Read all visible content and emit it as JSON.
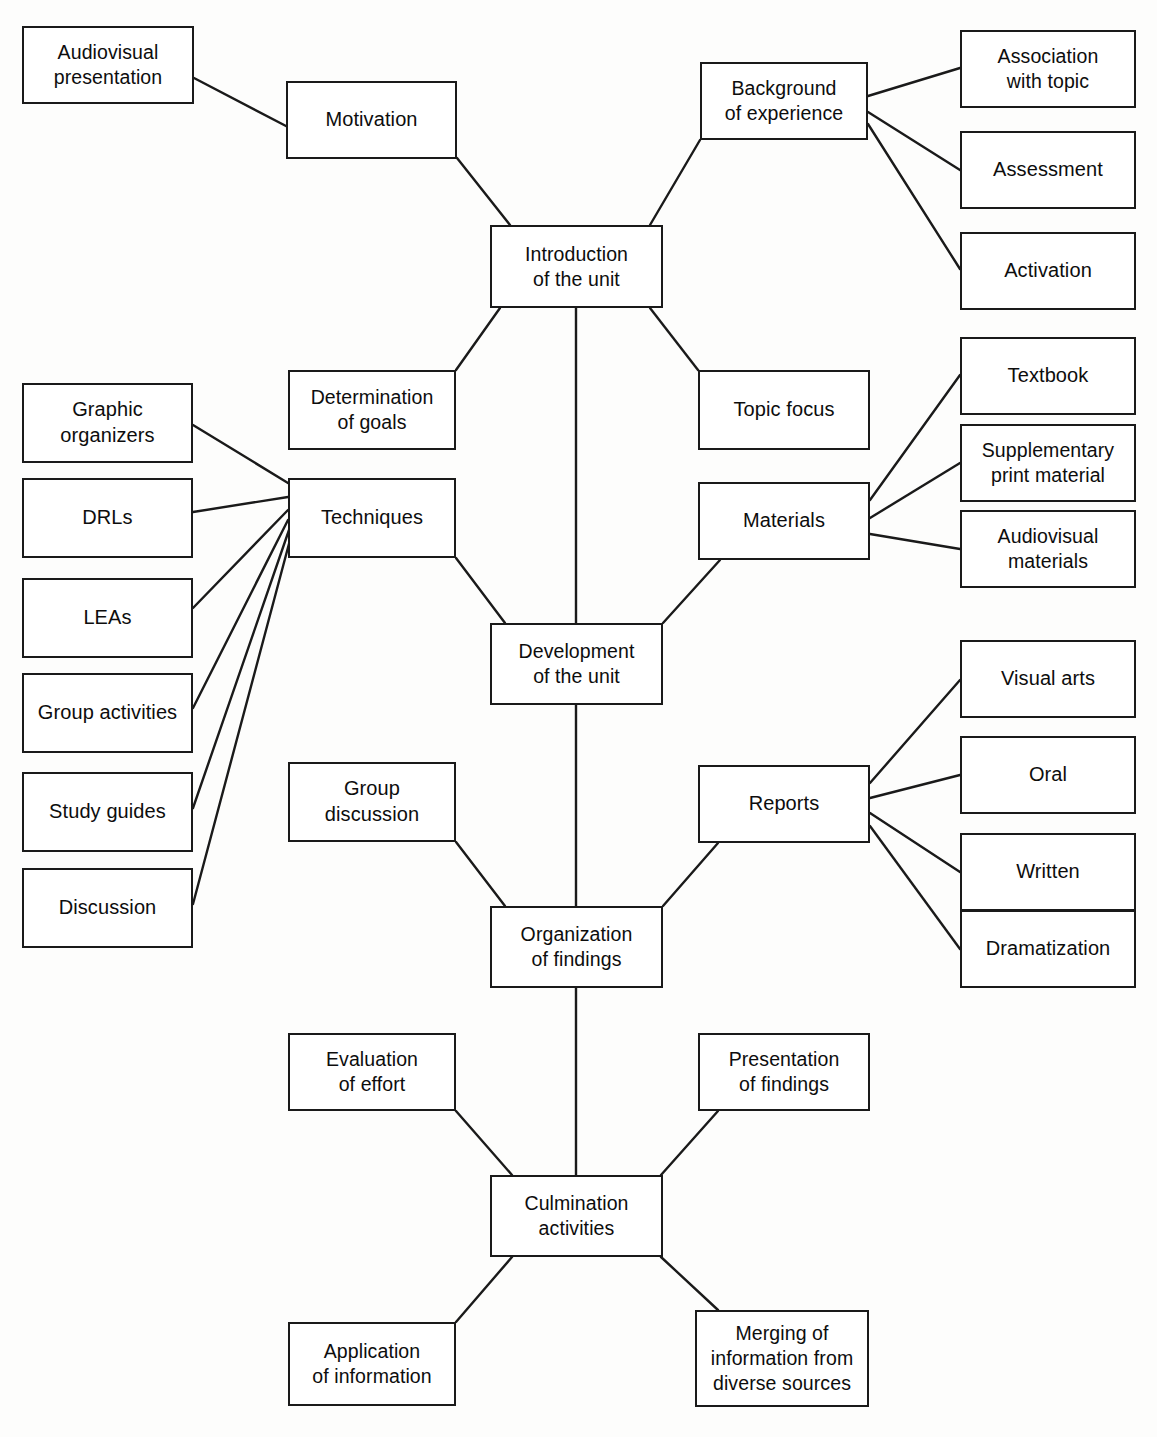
{
  "diagram": {
    "type": "hierarchical-flow",
    "line_color": "#1a1a1a",
    "box_fill": "#ffffff",
    "background": "#fdfdfc",
    "ghost_text": "",
    "nodes": [
      {
        "id": "audiovisual_presentation",
        "label": "Audiovisual\npresentation",
        "x": 22,
        "y": 26,
        "w": 172,
        "h": 78
      },
      {
        "id": "motivation",
        "label": "Motivation",
        "x": 286,
        "y": 81,
        "w": 171,
        "h": 78
      },
      {
        "id": "background_of_experience",
        "label": "Background\nof experience",
        "x": 700,
        "y": 62,
        "w": 168,
        "h": 78
      },
      {
        "id": "association_with_topic",
        "label": "Association\nwith topic",
        "x": 960,
        "y": 30,
        "w": 176,
        "h": 78
      },
      {
        "id": "assessment",
        "label": "Assessment",
        "x": 960,
        "y": 131,
        "w": 176,
        "h": 78
      },
      {
        "id": "activation",
        "label": "Activation",
        "x": 960,
        "y": 232,
        "w": 176,
        "h": 78
      },
      {
        "id": "introduction_of_the_unit",
        "label": "Introduction\nof the unit",
        "x": 490,
        "y": 225,
        "w": 173,
        "h": 83
      },
      {
        "id": "graphic_organizers",
        "label": "Graphic\norganizers",
        "x": 22,
        "y": 383,
        "w": 171,
        "h": 80
      },
      {
        "id": "drls",
        "label": "DRLs",
        "x": 22,
        "y": 478,
        "w": 171,
        "h": 80
      },
      {
        "id": "leas",
        "label": "LEAs",
        "x": 22,
        "y": 578,
        "w": 171,
        "h": 80
      },
      {
        "id": "group_activities",
        "label": "Group activities",
        "x": 22,
        "y": 673,
        "w": 171,
        "h": 80
      },
      {
        "id": "study_guides",
        "label": "Study guides",
        "x": 22,
        "y": 772,
        "w": 171,
        "h": 80
      },
      {
        "id": "discussion",
        "label": "Discussion",
        "x": 22,
        "y": 868,
        "w": 171,
        "h": 80
      },
      {
        "id": "determination_of_goals",
        "label": "Determination\nof goals",
        "x": 288,
        "y": 370,
        "w": 168,
        "h": 80
      },
      {
        "id": "techniques",
        "label": "Techniques",
        "x": 288,
        "y": 478,
        "w": 168,
        "h": 80
      },
      {
        "id": "topic_focus",
        "label": "Topic focus",
        "x": 698,
        "y": 370,
        "w": 172,
        "h": 80
      },
      {
        "id": "materials",
        "label": "Materials",
        "x": 698,
        "y": 482,
        "w": 172,
        "h": 78
      },
      {
        "id": "textbook",
        "label": "Textbook",
        "x": 960,
        "y": 337,
        "w": 176,
        "h": 78
      },
      {
        "id": "supplementary_print",
        "label": "Supplementary\nprint material",
        "x": 960,
        "y": 424,
        "w": 176,
        "h": 78
      },
      {
        "id": "audiovisual_materials",
        "label": "Audiovisual\nmaterials",
        "x": 960,
        "y": 510,
        "w": 176,
        "h": 78
      },
      {
        "id": "development_of_the_unit",
        "label": "Development\nof the unit",
        "x": 490,
        "y": 623,
        "w": 173,
        "h": 82
      },
      {
        "id": "visual_arts",
        "label": "Visual arts",
        "x": 960,
        "y": 640,
        "w": 176,
        "h": 78
      },
      {
        "id": "oral",
        "label": "Oral",
        "x": 960,
        "y": 736,
        "w": 176,
        "h": 78
      },
      {
        "id": "written",
        "label": "Written",
        "x": 960,
        "y": 833,
        "w": 176,
        "h": 78
      },
      {
        "id": "dramatization",
        "label": "Dramatization",
        "x": 960,
        "y": 910,
        "w": 176,
        "h": 78
      },
      {
        "id": "group_discussion",
        "label": "Group\ndiscussion",
        "x": 288,
        "y": 762,
        "w": 168,
        "h": 80
      },
      {
        "id": "reports",
        "label": "Reports",
        "x": 698,
        "y": 765,
        "w": 172,
        "h": 78
      },
      {
        "id": "organization_of_findings",
        "label": "Organization\nof findings",
        "x": 490,
        "y": 906,
        "w": 173,
        "h": 82
      },
      {
        "id": "evaluation_of_effort",
        "label": "Evaluation\nof effort",
        "x": 288,
        "y": 1033,
        "w": 168,
        "h": 78
      },
      {
        "id": "presentation_of_findings",
        "label": "Presentation\nof findings",
        "x": 698,
        "y": 1033,
        "w": 172,
        "h": 78
      },
      {
        "id": "culmination_activities",
        "label": "Culmination\nactivities",
        "x": 490,
        "y": 1175,
        "w": 173,
        "h": 82
      },
      {
        "id": "application_of_information",
        "label": "Application\nof information",
        "x": 288,
        "y": 1322,
        "w": 168,
        "h": 84
      },
      {
        "id": "merging_of_information",
        "label": "Merging of\ninformation from\ndiverse sources",
        "x": 695,
        "y": 1310,
        "w": 174,
        "h": 97
      }
    ],
    "edges": [
      {
        "from": "audiovisual_presentation",
        "to": "motivation",
        "x1": 194,
        "y1": 78,
        "x2": 286,
        "y2": 126
      },
      {
        "from": "motivation",
        "to": "introduction_of_the_unit",
        "x1": 457,
        "y1": 158,
        "x2": 510,
        "y2": 225
      },
      {
        "from": "background_of_experience",
        "to": "introduction_of_the_unit",
        "x1": 700,
        "y1": 140,
        "x2": 650,
        "y2": 225
      },
      {
        "from": "background_of_experience",
        "to": "association_with_topic",
        "x1": 868,
        "y1": 96,
        "x2": 960,
        "y2": 68
      },
      {
        "from": "background_of_experience",
        "to": "assessment",
        "x1": 868,
        "y1": 112,
        "x2": 960,
        "y2": 170
      },
      {
        "from": "background_of_experience",
        "to": "activation",
        "x1": 868,
        "y1": 124,
        "x2": 960,
        "y2": 269
      },
      {
        "from": "introduction_of_the_unit",
        "to": "determination_of_goals",
        "x1": 500,
        "y1": 308,
        "x2": 456,
        "y2": 370
      },
      {
        "from": "introduction_of_the_unit",
        "to": "topic_focus",
        "x1": 650,
        "y1": 308,
        "x2": 698,
        "y2": 370
      },
      {
        "from": "introduction_of_the_unit",
        "to": "development_of_the_unit",
        "x1": 576,
        "y1": 308,
        "x2": 576,
        "y2": 623
      },
      {
        "from": "graphic_organizers",
        "to": "techniques",
        "x1": 193,
        "y1": 425,
        "x2": 288,
        "y2": 483
      },
      {
        "from": "drls",
        "to": "techniques",
        "x1": 193,
        "y1": 512,
        "x2": 288,
        "y2": 497
      },
      {
        "from": "leas",
        "to": "techniques",
        "x1": 193,
        "y1": 608,
        "x2": 288,
        "y2": 510
      },
      {
        "from": "group_activities",
        "to": "techniques",
        "x1": 193,
        "y1": 708,
        "x2": 288,
        "y2": 520
      },
      {
        "from": "study_guides",
        "to": "techniques",
        "x1": 193,
        "y1": 808,
        "x2": 289,
        "y2": 530
      },
      {
        "from": "discussion",
        "to": "techniques",
        "x1": 193,
        "y1": 904,
        "x2": 290,
        "y2": 540
      },
      {
        "from": "techniques",
        "to": "development_of_the_unit",
        "x1": 456,
        "y1": 558,
        "x2": 505,
        "y2": 623
      },
      {
        "from": "materials",
        "to": "textbook",
        "x1": 870,
        "y1": 500,
        "x2": 960,
        "y2": 375
      },
      {
        "from": "materials",
        "to": "supplementary_print",
        "x1": 870,
        "y1": 518,
        "x2": 960,
        "y2": 463
      },
      {
        "from": "materials",
        "to": "audiovisual_materials",
        "x1": 870,
        "y1": 534,
        "x2": 960,
        "y2": 549
      },
      {
        "from": "materials",
        "to": "development_of_the_unit",
        "x1": 720,
        "y1": 560,
        "x2": 663,
        "y2": 623
      },
      {
        "from": "development_of_the_unit",
        "to": "organization_of_findings",
        "x1": 576,
        "y1": 705,
        "x2": 576,
        "y2": 906
      },
      {
        "from": "group_discussion",
        "to": "organization_of_findings",
        "x1": 456,
        "y1": 842,
        "x2": 505,
        "y2": 906
      },
      {
        "from": "reports",
        "to": "organization_of_findings",
        "x1": 718,
        "y1": 843,
        "x2": 663,
        "y2": 906
      },
      {
        "from": "reports",
        "to": "visual_arts",
        "x1": 870,
        "y1": 783,
        "x2": 960,
        "y2": 680
      },
      {
        "from": "reports",
        "to": "oral",
        "x1": 870,
        "y1": 798,
        "x2": 960,
        "y2": 775
      },
      {
        "from": "reports",
        "to": "written",
        "x1": 870,
        "y1": 813,
        "x2": 960,
        "y2": 872
      },
      {
        "from": "reports",
        "to": "dramatization",
        "x1": 870,
        "y1": 826,
        "x2": 960,
        "y2": 949
      },
      {
        "from": "organization_of_findings",
        "to": "culmination_activities",
        "x1": 576,
        "y1": 988,
        "x2": 576,
        "y2": 1175
      },
      {
        "from": "evaluation_of_effort",
        "to": "culmination_activities",
        "x1": 456,
        "y1": 1111,
        "x2": 512,
        "y2": 1175
      },
      {
        "from": "presentation_of_findings",
        "to": "culmination_activities",
        "x1": 718,
        "y1": 1111,
        "x2": 661,
        "y2": 1175
      },
      {
        "from": "culmination_activities",
        "to": "application_of_information",
        "x1": 512,
        "y1": 1257,
        "x2": 456,
        "y2": 1322
      },
      {
        "from": "culmination_activities",
        "to": "merging_of_information",
        "x1": 661,
        "y1": 1257,
        "x2": 718,
        "y2": 1310
      }
    ]
  }
}
